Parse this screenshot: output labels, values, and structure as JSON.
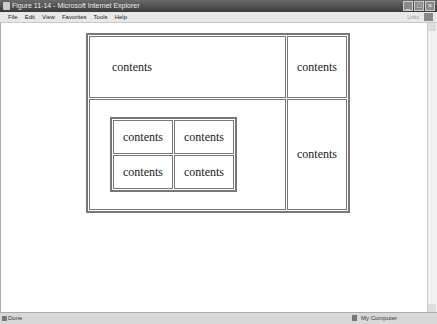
{
  "window": {
    "title": "Figure 11-14 - Microsoft Internet Explorer",
    "buttons": [
      "minimize",
      "maximize",
      "close"
    ]
  },
  "menubar": {
    "items": [
      "File",
      "Edit",
      "View",
      "Favorites",
      "Tools",
      "Help"
    ],
    "links_label": "Links"
  },
  "page": {
    "outer_table": {
      "top_left": "contents",
      "top_right": "contents",
      "bottom_right": "contents",
      "inner_table": [
        [
          "contents",
          "contents"
        ],
        [
          "contents",
          "contents"
        ]
      ]
    }
  },
  "statusbar": {
    "status": "Done",
    "zone": "My Computer"
  }
}
